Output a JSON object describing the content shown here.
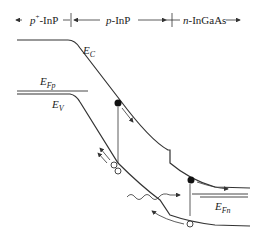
{
  "regions": [
    {
      "label_italic": "p",
      "label_sup": "+",
      "label_rest": "-InP"
    },
    {
      "label_italic": "p",
      "label_rest": "-InP"
    },
    {
      "label_italic": "n",
      "label_rest": "-InGaAs"
    }
  ],
  "band_labels": {
    "conduction": {
      "main": "E",
      "sub": "C"
    },
    "valence": {
      "main": "E",
      "sub": "V"
    },
    "fermi_p": {
      "main": "E",
      "sub": "Fp"
    },
    "fermi_n": {
      "main": "E",
      "sub": "Fn"
    }
  },
  "colors": {
    "line": "#333333",
    "background": "#ffffff"
  }
}
